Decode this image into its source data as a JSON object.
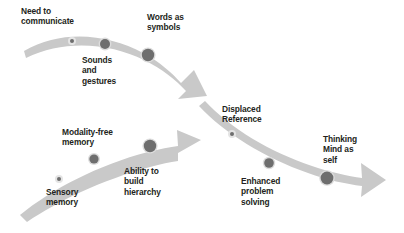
{
  "diagram": {
    "type": "three-stage-arrow-flow",
    "background_color": "#ffffff",
    "arrow_fill": "#c9c9c9",
    "arrow_fill_light": "#d6d6d6",
    "dot_color": "#6e6e6e",
    "dot_ring_color": "#e2e2e2",
    "text_color": "#231f20",
    "arrows": [
      {
        "name": "arrow-communication",
        "direction": "down-right",
        "order": 1
      },
      {
        "name": "arrow-memory",
        "direction": "right-up",
        "order": 2
      },
      {
        "name": "arrow-thinking",
        "direction": "down-right",
        "order": 3
      }
    ],
    "labels": [
      {
        "id": "need-to-communicate",
        "text": "Need to\ncommunicate",
        "x": 21,
        "y": 6,
        "arrow": "arrow-communication",
        "dot_size": "small"
      },
      {
        "id": "sounds-and-gestures",
        "text": "Sounds\nand\ngestures",
        "x": 82,
        "y": 55,
        "arrow": "arrow-communication",
        "dot_size": "medium"
      },
      {
        "id": "words-as-symbols",
        "text": "Words as\nsymbols",
        "x": 147,
        "y": 12,
        "arrow": "arrow-communication",
        "dot_size": "large"
      },
      {
        "id": "sensory-memory",
        "text": "Sensory\nmemory",
        "x": 46,
        "y": 187,
        "arrow": "arrow-memory",
        "dot_size": "small"
      },
      {
        "id": "modality-free-memory",
        "text": "Modality-free\nmemory",
        "x": 62,
        "y": 127,
        "arrow": "arrow-memory",
        "dot_size": "medium"
      },
      {
        "id": "ability-to-build-hierarchy",
        "text": "Ability to\nbuild\nhierarchy",
        "x": 124,
        "y": 166,
        "arrow": "arrow-memory",
        "dot_size": "large"
      },
      {
        "id": "displaced-reference",
        "text": "Displaced\nReference",
        "x": 222,
        "y": 104,
        "arrow": "arrow-thinking",
        "dot_size": "small"
      },
      {
        "id": "enhanced-problem-solving",
        "text": "Enhanced\nproblem\nsolving",
        "x": 241,
        "y": 176,
        "arrow": "arrow-thinking",
        "dot_size": "medium"
      },
      {
        "id": "thinking-mind-as-self",
        "text": "Thinking\nMind as\nself",
        "x": 323,
        "y": 134,
        "arrow": "arrow-thinking",
        "dot_size": "large"
      }
    ],
    "dots": [
      {
        "id": "dot-need-to-communicate",
        "cx": 72,
        "cy": 41,
        "r": 2.0
      },
      {
        "id": "dot-sounds-and-gestures",
        "cx": 105,
        "cy": 44,
        "r": 5.0
      },
      {
        "id": "dot-words-as-symbols",
        "cx": 148,
        "cy": 55,
        "r": 6.2
      },
      {
        "id": "dot-sensory-memory",
        "cx": 59,
        "cy": 179,
        "r": 2.0
      },
      {
        "id": "dot-modality-free-memory",
        "cx": 94,
        "cy": 159,
        "r": 4.6
      },
      {
        "id": "dot-ability-to-build-hierarchy",
        "cx": 150,
        "cy": 146,
        "r": 6.2
      },
      {
        "id": "dot-displaced-reference",
        "cx": 232,
        "cy": 134,
        "r": 2.0
      },
      {
        "id": "dot-enhanced-problem-solving",
        "cx": 269,
        "cy": 163,
        "r": 4.8
      },
      {
        "id": "dot-thinking-mind-as-self",
        "cx": 327,
        "cy": 178,
        "r": 6.4
      }
    ]
  }
}
